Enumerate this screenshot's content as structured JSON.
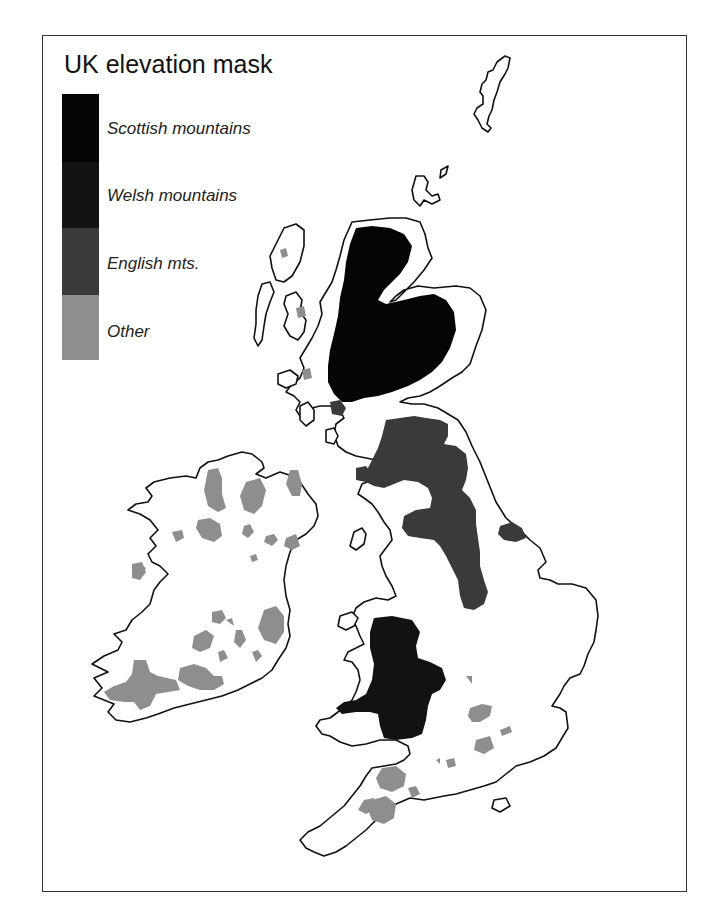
{
  "header": {
    "cut_off_text": "… ( … ) … … … … …"
  },
  "figure": {
    "title": "UK elevation mask",
    "legend": {
      "items": [
        {
          "label": "Scottish mountains",
          "color": "#050505"
        },
        {
          "label": "Welsh mountains",
          "color": "#121212"
        },
        {
          "label": "English mts.",
          "color": "#3a3a3a"
        },
        {
          "label": "Other",
          "color": "#8e8e8e"
        }
      ]
    },
    "map": {
      "outline_color": "#111111",
      "land_color": "#ffffff",
      "regions": [
        {
          "name": "Scotland",
          "mask": "Scottish mountains"
        },
        {
          "name": "Wales",
          "mask": "Welsh mountains"
        },
        {
          "name": "Northern England",
          "mask": "English mts."
        },
        {
          "name": "Ireland",
          "mask": "Other"
        },
        {
          "name": "Southern England",
          "mask": "Other"
        }
      ]
    }
  }
}
